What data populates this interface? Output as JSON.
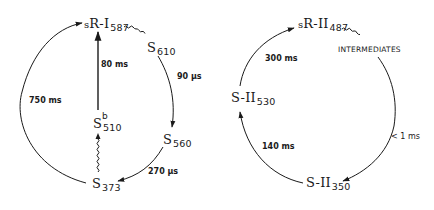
{
  "diagram": {
    "type": "photocycle-reaction-scheme",
    "left_cycle": {
      "name": "sR-I photocycle",
      "states": {
        "start": {
          "prefix": "s",
          "base": "R-I",
          "subscript": "587"
        },
        "s610": {
          "base": "S",
          "subscript": "610"
        },
        "s560": {
          "base": "S",
          "subscript": "560"
        },
        "s373": {
          "base": "S",
          "subscript": "373"
        },
        "s510b": {
          "base": "S",
          "superscript": "b",
          "subscript": "510"
        }
      },
      "transitions": [
        {
          "from": "sR-I587",
          "to": "S610",
          "label": "",
          "style": "wavy (photon)"
        },
        {
          "from": "S610",
          "to": "S560",
          "label": "90 µs",
          "style": "arrow"
        },
        {
          "from": "S560",
          "to": "S373",
          "label": "270 µs",
          "style": "arrow"
        },
        {
          "from": "S373",
          "to": "sR-I587",
          "label": "750 ms",
          "style": "arrow"
        },
        {
          "from": "S373",
          "to": "Sb510",
          "label": "",
          "style": "wavy (photon)"
        },
        {
          "from": "Sb510",
          "to": "sR-I587",
          "label": "80 ms",
          "style": "arrow"
        }
      ],
      "rate_labels": {
        "r90us": "90 µs",
        "r270us": "270 µs",
        "r750ms": "750 ms",
        "r80ms": "80 ms"
      }
    },
    "right_cycle": {
      "name": "sR-II photocycle",
      "states": {
        "start": {
          "prefix": "s",
          "base": "R-II",
          "subscript": "487"
        },
        "intermediates": "INTERMEDIATES",
        "s350": {
          "base": "S-II",
          "subscript": "350"
        },
        "s530": {
          "base": "S-II",
          "subscript": "530"
        }
      },
      "transitions": [
        {
          "from": "sR-II487",
          "to": "INTERMEDIATES",
          "label": "",
          "style": "wavy (photon)"
        },
        {
          "from": "INTERMEDIATES",
          "to": "S-II350",
          "label": "< 1 ms",
          "style": "arrow"
        },
        {
          "from": "S-II350",
          "to": "S-II530",
          "label": "140 ms",
          "style": "arrow"
        },
        {
          "from": "S-II530",
          "to": "sR-II487",
          "label": "300 ms",
          "style": "arrow"
        }
      ],
      "rate_labels": {
        "r1ms": "< 1 ms",
        "r140ms": "140 ms",
        "r300ms": "300 ms"
      }
    }
  }
}
